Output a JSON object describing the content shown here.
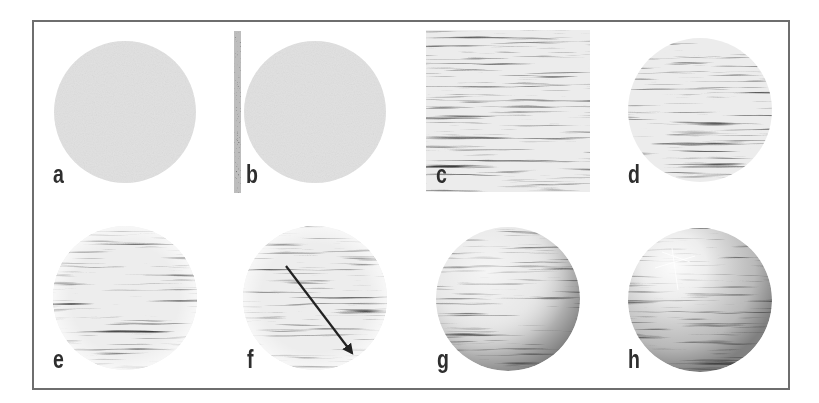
{
  "figure": {
    "panels": [
      {
        "id": "a",
        "label": "a",
        "kind": "flat-disc-noise"
      },
      {
        "id": "b",
        "label": "b",
        "kind": "flat-disc-with-noise-strip"
      },
      {
        "id": "c",
        "label": "c",
        "kind": "streaked-noise-square"
      },
      {
        "id": "d",
        "label": "d",
        "kind": "streaked-noise-disc"
      },
      {
        "id": "e",
        "label": "e",
        "kind": "spherized-streaks"
      },
      {
        "id": "f",
        "label": "f",
        "kind": "spherized-streaks-with-arrow"
      },
      {
        "id": "g",
        "label": "g",
        "kind": "shaded-sphere"
      },
      {
        "id": "h",
        "label": "h",
        "kind": "shaded-sphere-with-highlight"
      }
    ],
    "colors": {
      "frame": "#6e6e6e",
      "disc_fill": "#e2e2e2",
      "streak_dark": "#4a4a4a",
      "streak_light": "#f4f4f4",
      "label": "#2e2e2e",
      "arrow": "#222222"
    }
  }
}
